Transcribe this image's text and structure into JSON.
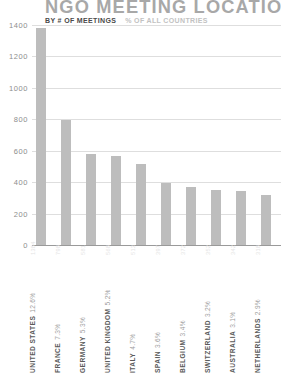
{
  "chart_data": {
    "type": "bar",
    "title": "NGO MEETING LOCATION",
    "subtitle": "",
    "xlabel": "",
    "ylabel": "",
    "ylim": [
      0,
      1400
    ],
    "yticks": [
      1400,
      1200,
      1000,
      800,
      600,
      400,
      200,
      0
    ],
    "grid": true,
    "legend_position": "top-left",
    "legend": [
      {
        "label": "BY # OF MEETINGS",
        "color": "#4a4a4a",
        "emphasis": "primary"
      },
      {
        "label": "% OF ALL COUNTRIES",
        "color": "#c2c2c2",
        "emphasis": "secondary"
      }
    ],
    "bar_color": "#bdbdbd",
    "categories": [
      "UNITED STATES",
      "FRANCE",
      "GERMANY",
      "UNITED KINGDOM",
      "ITALY",
      "SPAIN",
      "BELGIUM",
      "SWITZERLAND",
      "AUSTRALIA",
      "NETHERLANDS"
    ],
    "values": [
      1384,
      798,
      581,
      568,
      513,
      397,
      372,
      352,
      342,
      318
    ],
    "percents": [
      "12.6%",
      "7.3%",
      "5.3%",
      "5.2%",
      "4.7%",
      "3.6%",
      "3.4%",
      "3.2%",
      "3.1%",
      "2.9%"
    ],
    "points": [
      {
        "category": "UNITED STATES",
        "value": 1384,
        "percent": "12.6%"
      },
      {
        "category": "FRANCE",
        "value": 798,
        "percent": "7.3%"
      },
      {
        "category": "GERMANY",
        "value": 581,
        "percent": "5.3%"
      },
      {
        "category": "UNITED KINGDOM",
        "value": 568,
        "percent": "5.2%"
      },
      {
        "category": "ITALY",
        "value": 513,
        "percent": "4.7%"
      },
      {
        "category": "SPAIN",
        "value": 397,
        "percent": "3.6%"
      },
      {
        "category": "BELGIUM",
        "value": 372,
        "percent": "3.4%"
      },
      {
        "category": "SWITZERLAND",
        "value": 352,
        "percent": "3.2%"
      },
      {
        "category": "AUSTRALIA",
        "value": 342,
        "percent": "3.1%"
      },
      {
        "category": "NETHERLANDS",
        "value": 318,
        "percent": "2.9%"
      }
    ]
  }
}
